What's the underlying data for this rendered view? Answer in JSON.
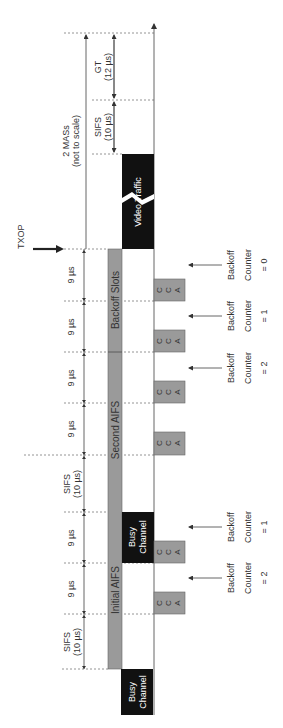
{
  "diagram": {
    "txop_label": "TXOP",
    "total_span": {
      "line1": "2 MASs",
      "line2": "(not to scale)"
    },
    "guard_time": {
      "line1": "GT",
      "line2": "(12 µs)"
    },
    "upper_sifs": {
      "line1": "SIFS",
      "line2": "(10 µs)"
    },
    "phases": {
      "initial_aifs": "Initial AIFS",
      "second_aifs": "Second AIFS",
      "backoff_slots": "Backoff Slots"
    },
    "blocks": {
      "busy_start": {
        "line1": "Busy",
        "line2": "Channel"
      },
      "busy_mid": {
        "line1": "Busy",
        "line2": "Channel"
      },
      "video": {
        "line1": "Video Traffic"
      }
    },
    "intervals": [
      {
        "id": "sifs1",
        "line1": "SIFS",
        "line2": "(10 µs)"
      },
      {
        "id": "slot1",
        "line1": "9 µs"
      },
      {
        "id": "slot2",
        "line1": "9 µs"
      },
      {
        "id": "sifs2",
        "line1": "SIFS",
        "line2": "(10 µs)"
      },
      {
        "id": "slot3",
        "line1": "9 µs"
      },
      {
        "id": "slot4",
        "line1": "9 µs"
      },
      {
        "id": "slot5",
        "line1": "9 µs"
      },
      {
        "id": "slot6",
        "line1": "9 µs"
      }
    ],
    "cca": {
      "c1": "C",
      "c2": "C",
      "c3": "A"
    },
    "counters": [
      {
        "line1": "Backoff",
        "line2": "Counter",
        "line3": "= 2"
      },
      {
        "line1": "Backoff",
        "line2": "Counter",
        "line3": "= 1"
      },
      {
        "line1": "Backoff",
        "line2": "Counter",
        "line3": "= 2"
      },
      {
        "line1": "Backoff",
        "line2": "Counter",
        "line3": "= 1"
      },
      {
        "line1": "Backoff",
        "line2": "Counter",
        "line3": "= 0"
      }
    ],
    "colors": {
      "gray_bar": "#9a9a9a",
      "black_block": "#111111",
      "lines": "#555555"
    }
  }
}
